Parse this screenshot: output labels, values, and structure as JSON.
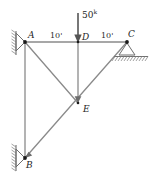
{
  "figure": {
    "type": "truss-free-body-diagram",
    "colors": {
      "member": "#8a8a8a",
      "joint": "#1a1a1a",
      "load_arrow": "#555555",
      "support_hatch": "#7a7a7a",
      "text": "#252525",
      "background": "#ffffff"
    }
  },
  "load": {
    "magnitude": "50",
    "unit_superscript": "k",
    "direction": "down",
    "applied_at": "D"
  },
  "dimensions": [
    {
      "label": "10'",
      "from": "A",
      "to": "D"
    },
    {
      "label": "10'",
      "from": "D",
      "to": "C"
    }
  ],
  "joints": [
    {
      "label": "A",
      "x": 25,
      "y": 42,
      "support": "pin-wall-left"
    },
    {
      "label": "D",
      "x": 78,
      "y": 42,
      "support": "none"
    },
    {
      "label": "C",
      "x": 127,
      "y": 42,
      "support": "roller-ground"
    },
    {
      "label": "E",
      "x": 78,
      "y": 103,
      "support": "none"
    },
    {
      "label": "B",
      "x": 25,
      "y": 158,
      "support": "pin-wall-left"
    }
  ],
  "members": [
    {
      "from": "A",
      "to": "D"
    },
    {
      "from": "D",
      "to": "C"
    },
    {
      "from": "A",
      "to": "B"
    },
    {
      "from": "A",
      "to": "E"
    },
    {
      "from": "D",
      "to": "E"
    },
    {
      "from": "B",
      "to": "C"
    }
  ],
  "supports": {
    "A": "pin-wall-left",
    "B": "pin-wall-left",
    "C": "roller-ground"
  }
}
